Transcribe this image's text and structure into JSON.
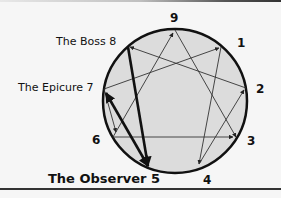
{
  "diagram": {
    "type": "enneagram",
    "points": [
      {
        "number": "9",
        "name": ""
      },
      {
        "number": "1",
        "name": ""
      },
      {
        "number": "2",
        "name": ""
      },
      {
        "number": "3",
        "name": ""
      },
      {
        "number": "4",
        "name": ""
      },
      {
        "number": "5",
        "name": "The Observer"
      },
      {
        "number": "6",
        "name": ""
      },
      {
        "number": "7",
        "name": "The Epicure"
      },
      {
        "number": "8",
        "name": "The Boss"
      }
    ],
    "labels": {
      "p9": "9",
      "p1": "1",
      "p2": "2",
      "p3": "3",
      "p4": "4",
      "p6": "6",
      "p8": "The Boss 8",
      "p7": "The Epicure 7",
      "p5": "The Observer 5"
    },
    "highlighted_connections": [
      "8-5",
      "7-5"
    ],
    "colors": {
      "circle_fill": "#dcdcdc",
      "circle_stroke": "#111111",
      "line": "#333333",
      "highlight": "#111111",
      "background": "#f6f6f6"
    }
  }
}
